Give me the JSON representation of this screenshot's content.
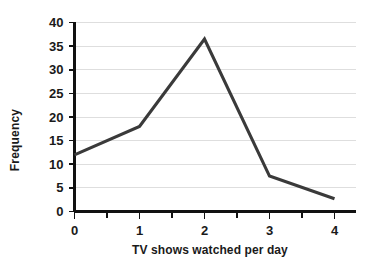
{
  "chart_data": {
    "type": "line",
    "title": "",
    "subtitle": "",
    "xlabel": "TV shows watched per day",
    "ylabel": "Frequency",
    "x": [
      0,
      1,
      2,
      3,
      4
    ],
    "values": [
      12,
      18,
      36.5,
      7.5,
      2.7
    ],
    "categories": [
      "0",
      "1",
      "2",
      "3",
      "4"
    ],
    "series": [
      {
        "name": "Frequency",
        "values": [
          12,
          18,
          36.5,
          7.5,
          2.7
        ]
      }
    ],
    "xlim": [
      0,
      4
    ],
    "ylim": [
      0,
      40
    ],
    "ytick_labels": [
      "0",
      "5",
      "10",
      "15",
      "20",
      "25",
      "30",
      "35",
      "40"
    ],
    "ytick_values": [
      0,
      5,
      10,
      15,
      20,
      25,
      30,
      35,
      40
    ],
    "xtick_labels": [
      "0",
      "1",
      "2",
      "3",
      "4"
    ],
    "xtick_values": [
      0,
      1,
      2,
      3,
      4
    ],
    "x_minor_ticks": [
      0.5,
      1.5,
      2.5,
      3.5
    ],
    "grid": "horizontal",
    "legend": "none",
    "annotations": [],
    "colors": {
      "line": "#3a3a3a",
      "grid": "#dedede",
      "axis": "#111111",
      "text": "#1a1a1a",
      "background": "#ffffff"
    }
  }
}
